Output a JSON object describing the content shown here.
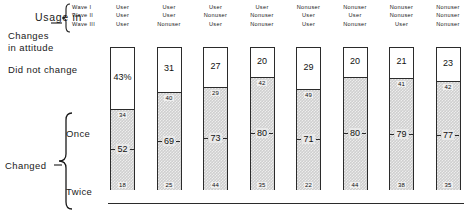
{
  "labels": {
    "usage_in": "Usage in",
    "waves": [
      "Wave I",
      "Wave II",
      "Wave III"
    ],
    "changes_in_attitude": [
      "Changes",
      "in attitude"
    ],
    "did_not_change": "Did not change",
    "changed": "Changed",
    "once": "Once",
    "twice": "Twice"
  },
  "chart_data": {
    "type": "bar",
    "title": "",
    "xlabel": "",
    "ylabel": "",
    "ylim": [
      0,
      100
    ],
    "grid": false,
    "legend_position": "left-labels",
    "stacked": true,
    "note": "Stacked 100% columns. Top white segment = Did not change. Lower shaded segment = Changed (total), with sub-values for Once (upper) and Twice (lower).",
    "categories": [
      "User / User / User",
      "User / User / Nonuser",
      "User / Nonuser / User",
      "User / Nonuser / Nonuser",
      "Nonuser / User / User",
      "Nonuser / User / Nonuser",
      "Nonuser / Nonuser / User",
      "Nonuser / Nonuser / Nonuser"
    ],
    "column_headers": [
      [
        "User",
        "User",
        "User"
      ],
      [
        "User",
        "User",
        "Nonuser"
      ],
      [
        "User",
        "Nonuser",
        "User"
      ],
      [
        "User",
        "Nonuser",
        "Nonuser"
      ],
      [
        "Nonuser",
        "User",
        "User"
      ],
      [
        "Nonuser",
        "User",
        "Nonuser"
      ],
      [
        "Nonuser",
        "Nonuser",
        "User"
      ],
      [
        "Nonuser",
        "Nonuser",
        "Nonuser"
      ]
    ],
    "series": [
      {
        "name": "Did not change",
        "values": [
          43,
          31,
          27,
          20,
          29,
          20,
          21,
          23
        ],
        "labels": [
          "43%",
          "31",
          "27",
          "20",
          "29",
          "20",
          "21",
          "23"
        ]
      },
      {
        "name": "Changed (total)",
        "values": [
          52,
          69,
          73,
          80,
          71,
          80,
          79,
          77
        ],
        "labels": [
          "52",
          "69",
          "73",
          "80",
          "71",
          "80",
          "79",
          "77"
        ]
      }
    ],
    "sub_labels": {
      "once_top": [
        "34",
        "40",
        "29",
        "42",
        "49",
        "",
        "41",
        "42"
      ],
      "twice_bottom": [
        "18",
        "25",
        "44",
        "35",
        "22",
        "44",
        "38",
        "35"
      ]
    },
    "bars": [
      {
        "top_label": "43%",
        "top_value": 43,
        "once_label": "34",
        "mid_label": "52",
        "bottom_label": "18"
      },
      {
        "top_label": "31",
        "top_value": 31,
        "once_label": "40",
        "mid_label": "69",
        "bottom_label": "25"
      },
      {
        "top_label": "27",
        "top_value": 27,
        "once_label": "29",
        "mid_label": "73",
        "bottom_label": "44"
      },
      {
        "top_label": "20",
        "top_value": 20,
        "once_label": "42",
        "mid_label": "80",
        "bottom_label": "35"
      },
      {
        "top_label": "29",
        "top_value": 29,
        "once_label": "49",
        "mid_label": "71",
        "bottom_label": "22"
      },
      {
        "top_label": "20",
        "top_value": 20,
        "once_label": "",
        "mid_label": "80",
        "bottom_label": "44"
      },
      {
        "top_label": "21",
        "top_value": 21,
        "once_label": "41",
        "mid_label": "79",
        "bottom_label": "38"
      },
      {
        "top_label": "23",
        "top_value": 23,
        "once_label": "42",
        "mid_label": "77",
        "bottom_label": "35"
      }
    ]
  }
}
